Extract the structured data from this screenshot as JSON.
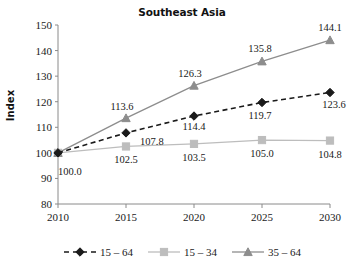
{
  "chart_data": {
    "type": "line",
    "title": "Southeast Asia",
    "xlabel": "",
    "ylabel": "Index",
    "x": [
      2010,
      2015,
      2020,
      2025,
      2030
    ],
    "xticklabels": [
      "2010",
      "2015",
      "2020",
      "2025",
      "2030"
    ],
    "yticks": [
      80,
      90,
      100,
      110,
      120,
      130,
      140,
      150
    ],
    "yticklabels": [
      "80",
      "90",
      "100",
      "110",
      "120",
      "130",
      "140",
      "150"
    ],
    "ylim": [
      80,
      150
    ],
    "xlim": [
      2010,
      2030
    ],
    "grid": false,
    "legend_position": "bottom",
    "series": [
      {
        "name": "15 – 64",
        "values": [
          100.0,
          107.8,
          114.4,
          119.7,
          123.6
        ],
        "labels": [
          "100.0",
          "107.8",
          "114.4",
          "119.7",
          "123.6"
        ],
        "color": "#1a1a1a",
        "marker": "diamond",
        "linestyle": "dashed"
      },
      {
        "name": "15 – 34",
        "values": [
          100.0,
          102.5,
          103.5,
          105.0,
          104.8
        ],
        "labels": [
          "100.0",
          "102.5",
          "103.5",
          "105.0",
          "104.8"
        ],
        "color": "#bdbdbd",
        "marker": "square",
        "linestyle": "solid"
      },
      {
        "name": "35 – 64",
        "values": [
          100.0,
          113.6,
          126.3,
          135.8,
          144.1
        ],
        "labels": [
          "100.0",
          "113.6",
          "126.3",
          "135.8",
          "144.1"
        ],
        "color": "#8d8d8d",
        "marker": "triangle",
        "linestyle": "solid"
      }
    ],
    "shared_origin_label": "100.0",
    "axis_color": "#8a8a8a"
  },
  "legend": {
    "items": [
      {
        "label": "15 – 64"
      },
      {
        "label": "15 – 34"
      },
      {
        "label": "35 – 64"
      }
    ]
  }
}
